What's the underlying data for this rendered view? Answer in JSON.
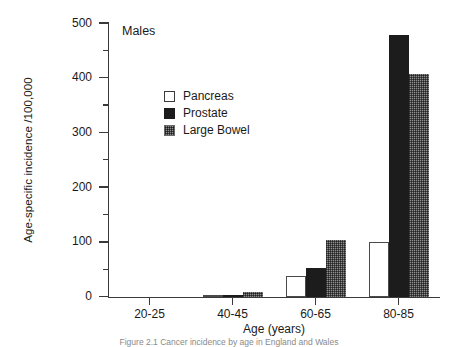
{
  "chart_data": {
    "type": "bar",
    "title": "",
    "panel_label": "Males",
    "xlabel": "Age (years)",
    "ylabel": "Age-specific incidence /100,000",
    "categories": [
      "20-25",
      "40-45",
      "60-65",
      "80-85"
    ],
    "ylim": [
      0,
      500
    ],
    "ytick_labels": [
      "0",
      "100",
      "200",
      "300",
      "400",
      "500"
    ],
    "ytick_values": [
      0,
      100,
      200,
      300,
      400,
      500
    ],
    "yminor_values": [
      50,
      150,
      250,
      350,
      450
    ],
    "grid": false,
    "legend_position": "upper-left-inside",
    "series": [
      {
        "name": "Pancreas",
        "values": [
          0,
          2,
          38,
          100
        ]
      },
      {
        "name": "Prostate",
        "values": [
          0,
          3,
          53,
          478
        ]
      },
      {
        "name": "Large Bowel",
        "values": [
          0,
          9,
          105,
          407
        ]
      }
    ]
  },
  "caption": {
    "text": "Figure 2.1  Cancer incidence by age in England and Wales"
  }
}
